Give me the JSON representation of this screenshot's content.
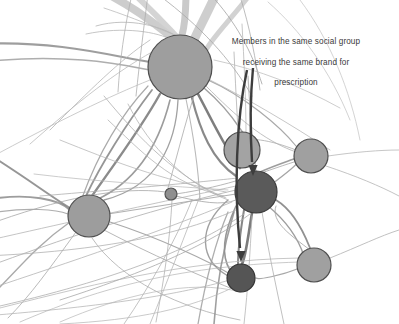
{
  "figure": {
    "type": "network-graph",
    "background_color": "#ffffff",
    "width": 399,
    "height": 324
  },
  "annotation": {
    "name": "social-group-annotation",
    "line1": "Members in the same social group",
    "line2": "receiving the same brand for",
    "line3": "prescription",
    "text_color": "#3a3a3a",
    "leader_color": "#3d3d3d",
    "targets": [
      "node-dark-center",
      "node-dark-bottom"
    ]
  },
  "chart_data": {
    "type": "scatter",
    "title": "",
    "xlabel": "",
    "ylabel": "",
    "xlim": [
      0,
      399
    ],
    "ylim": [
      0,
      324
    ],
    "grid": false,
    "legend": "none",
    "nodes": [
      {
        "id": "node-large-top",
        "x": 180,
        "y": 67,
        "r": 32,
        "fill": "#9e9e9e",
        "stroke": "#4f4f4f"
      },
      {
        "id": "node-left-mid",
        "x": 89,
        "y": 216,
        "r": 21,
        "fill": "#9d9d9d",
        "stroke": "#4f4f4f"
      },
      {
        "id": "node-small-center",
        "x": 171,
        "y": 194,
        "r": 6,
        "fill": "#8f8f8f",
        "stroke": "#525252"
      },
      {
        "id": "node-upper-right",
        "x": 242,
        "y": 150,
        "r": 18,
        "fill": "#a3a3a3",
        "stroke": "#4f4f4f"
      },
      {
        "id": "node-right",
        "x": 311,
        "y": 156,
        "r": 17,
        "fill": "#a0a0a0",
        "stroke": "#4f4f4f"
      },
      {
        "id": "node-dark-center",
        "x": 256,
        "y": 192,
        "r": 21,
        "fill": "#5a5a5a",
        "stroke": "#3a3a3a"
      },
      {
        "id": "node-dark-bottom",
        "x": 241,
        "y": 278,
        "r": 14,
        "fill": "#555555",
        "stroke": "#343434"
      },
      {
        "id": "node-bottom-right",
        "x": 314,
        "y": 265,
        "r": 17,
        "fill": "#a0a0a0",
        "stroke": "#4f4f4f"
      }
    ],
    "edges": [
      {
        "d": "M -20 44 C 60 40 120 58 150 62",
        "w": 2.2,
        "c": "#8d8d8d",
        "o": 0.85
      },
      {
        "d": "M -18 62 C 70 52 128 66 150 70",
        "w": 1.6,
        "c": "#9a9a9a",
        "o": 0.8
      },
      {
        "d": "M 100 -10 C 140 10 160 28 170 36",
        "w": 8.0,
        "c": "#c8c8c8",
        "o": 0.9
      },
      {
        "d": "M 132 -8 C 158 16 170 30 176 36",
        "w": 6.0,
        "c": "#cfcfcf",
        "o": 0.9
      },
      {
        "d": "M 186 -10 C 186 14 184 28 182 35",
        "w": 7.0,
        "c": "#c4c4c4",
        "o": 0.9
      },
      {
        "d": "M 216 -6 C 206 16 198 30 194 40",
        "w": 9.0,
        "c": "#c9c9c9",
        "o": 0.9
      },
      {
        "d": "M 252 -8 C 232 18 212 38 206 50",
        "w": 5.0,
        "c": "#cdcdcd",
        "o": 0.9
      },
      {
        "d": "M 96 26 C 130 16 164 28 176 36",
        "w": 1.0,
        "c": "#b4b4b4",
        "o": 0.8
      },
      {
        "d": "M 104 8 C 140 20 166 32 178 36",
        "w": 1.0,
        "c": "#bcbcbc",
        "o": 0.8
      },
      {
        "d": "M 86 34 C 124 26 158 32 172 40",
        "w": 1.0,
        "c": "#b8b8b8",
        "o": 0.8
      },
      {
        "d": "M 132 -6 C 124 30 120 60 118 92",
        "w": 1.0,
        "c": "#b2b2b2",
        "o": 0.8
      },
      {
        "d": "M 148 -6 C 144 26 140 58 136 96",
        "w": 1.0,
        "c": "#aeaeae",
        "o": 0.8
      },
      {
        "d": "M 160 -4 C 200 26 230 58 252 96",
        "w": 1.0,
        "c": "#a8a8a8",
        "o": 0.8
      },
      {
        "d": "M 210 -6 C 236 22 252 52 262 84",
        "w": 1.0,
        "c": "#a4a4a4",
        "o": 0.8
      },
      {
        "d": "M 240 -4 C 250 28 256 60 260 90",
        "w": 1.0,
        "c": "#acacac",
        "o": 0.8
      },
      {
        "d": "M 170 100 C 160 140 140 180 96 200",
        "w": 1.6,
        "c": "#8b8b8b",
        "o": 0.85
      },
      {
        "d": "M 178 100 C 176 140 160 186 104 200",
        "w": 1.3,
        "c": "#909090",
        "o": 0.85
      },
      {
        "d": "M 192 98 C 200 130 212 160 236 176",
        "w": 2.2,
        "c": "#7c7c7c",
        "o": 0.9
      },
      {
        "d": "M 198 94 C 214 124 226 150 240 168",
        "w": 2.6,
        "c": "#707070",
        "o": 0.9
      },
      {
        "d": "M 186 99 C 192 128 198 160 200 200",
        "w": 1.1,
        "c": "#a8a8a8",
        "o": 0.8
      },
      {
        "d": "M 204 88 C 232 112 240 130 244 134",
        "w": 1.4,
        "c": "#8f8f8f",
        "o": 0.85
      },
      {
        "d": "M 208 80 C 244 96 280 126 296 146",
        "w": 1.2,
        "c": "#9a9a9a",
        "o": 0.85
      },
      {
        "d": "M 160 94 C 140 130 110 170 92 196",
        "w": 2.4,
        "c": "#7e7e7e",
        "o": 0.9
      },
      {
        "d": "M 152 90 C 126 124 100 166 86 196",
        "w": 1.8,
        "c": "#888888",
        "o": 0.88
      },
      {
        "d": "M 148 86 C 118 118 96 160 82 198",
        "w": 1.2,
        "c": "#9b9b9b",
        "o": 0.85
      },
      {
        "d": "M -16 200 C 30 192 60 200 70 210",
        "w": 1.8,
        "c": "#8c8c8c",
        "o": 0.85
      },
      {
        "d": "M -14 214 C 28 206 58 210 68 214",
        "w": 1.2,
        "c": "#9c9c9c",
        "o": 0.82
      },
      {
        "d": "M -18 150 C 24 176 50 196 70 208",
        "w": 2.0,
        "c": "#848484",
        "o": 0.85
      },
      {
        "d": "M 110 222 C 160 238 210 262 230 274",
        "w": 1.2,
        "c": "#9a9a9a",
        "o": 0.85
      },
      {
        "d": "M 108 214 C 160 206 210 198 236 194",
        "w": 1.1,
        "c": "#a0a0a0",
        "o": 0.82
      },
      {
        "d": "M 104 230 C 150 254 200 276 240 292",
        "w": 1.0,
        "c": "#a6a6a6",
        "o": 0.8
      },
      {
        "d": "M 92 238 C 120 280 180 308 240 320",
        "w": 1.0,
        "c": "#adadad",
        "o": 0.8
      },
      {
        "d": "M 70 222 C 30 250 10 280 -14 300",
        "w": 1.4,
        "c": "#979797",
        "o": 0.82
      },
      {
        "d": "M 76 232 C 50 268 30 296 8 318",
        "w": 1.0,
        "c": "#a9a9a9",
        "o": 0.8
      },
      {
        "d": "M 240 168 C 238 130 236 96 234 52",
        "w": 1.0,
        "c": "#b0b0b0",
        "o": 0.78
      },
      {
        "d": "M 246 132 C 246 100 244 60 242 24",
        "w": 1.0,
        "c": "#b4b4b4",
        "o": 0.75
      },
      {
        "d": "M 256 171 C 252 140 250 110 248 76",
        "w": 1.2,
        "c": "#a8a8a8",
        "o": 0.78
      },
      {
        "d": "M 260 172 C 278 164 292 160 296 158",
        "w": 1.6,
        "c": "#8c8c8c",
        "o": 0.85
      },
      {
        "d": "M 272 184 C 288 172 296 166 298 162",
        "w": 1.4,
        "c": "#949494",
        "o": 0.85
      },
      {
        "d": "M 276 200 C 296 212 306 238 310 248",
        "w": 1.8,
        "c": "#828282",
        "o": 0.88
      },
      {
        "d": "M 268 206 C 290 224 300 244 304 256",
        "w": 1.4,
        "c": "#8e8e8e",
        "o": 0.86
      },
      {
        "d": "M 252 213 C 248 236 246 256 242 264",
        "w": 2.6,
        "c": "#6e6e6e",
        "o": 0.9
      },
      {
        "d": "M 244 210 C 240 234 238 254 238 264",
        "w": 2.0,
        "c": "#7a7a7a",
        "o": 0.9
      },
      {
        "d": "M 236 206 C 224 232 220 254 230 270",
        "w": 1.6,
        "c": "#888888",
        "o": 0.88
      },
      {
        "d": "M 228 200 C 196 228 200 260 228 276",
        "w": 1.4,
        "c": "#909090",
        "o": 0.86
      },
      {
        "d": "M 300 268 C 280 276 258 280 256 278",
        "w": 1.2,
        "c": "#999999",
        "o": 0.85
      },
      {
        "d": "M 310 250 C 292 236 270 222 276 206",
        "w": 1.0,
        "c": "#a3a3a3",
        "o": 0.82
      },
      {
        "d": "M 330 258 C 360 246 380 236 399 230",
        "w": 1.0,
        "c": "#b2b2b2",
        "o": 0.8
      },
      {
        "d": "M 328 156 C 356 152 380 150 399 150",
        "w": 1.0,
        "c": "#b6b6b6",
        "o": 0.78
      },
      {
        "d": "M 326 166 C 356 176 380 186 399 196",
        "w": 1.0,
        "c": "#b4b4b4",
        "o": 0.78
      },
      {
        "d": "M 296 150 C 270 140 250 136 226 142",
        "w": 1.0,
        "c": "#adadad",
        "o": 0.8
      },
      {
        "d": "M 294 162 C 262 172 230 186 176 194",
        "w": 1.0,
        "c": "#a6a6a6",
        "o": 0.8
      },
      {
        "d": "M 166 192 C 120 186 60 198 -16 226",
        "w": 1.0,
        "c": "#a8a8a8",
        "o": 0.8
      },
      {
        "d": "M 176 196 C 200 202 222 206 236 200",
        "w": 1.0,
        "c": "#a4a4a4",
        "o": 0.8
      },
      {
        "d": "M 168 188 C 176 160 186 120 194 96",
        "w": 1.0,
        "c": "#aaaaaa",
        "o": 0.8
      },
      {
        "d": "M 172 200 C 170 240 164 280 156 322",
        "w": 1.0,
        "c": "#b0b0b0",
        "o": 0.78
      },
      {
        "d": "M -16 268 C 60 240 140 212 236 190",
        "w": 1.0,
        "c": "#adadad",
        "o": 0.8
      },
      {
        "d": "M -14 290 C 70 262 160 232 232 202",
        "w": 1.0,
        "c": "#b2b2b2",
        "o": 0.78
      },
      {
        "d": "M -16 312 C 80 288 180 260 300 258",
        "w": 1.0,
        "c": "#b6b6b6",
        "o": 0.76
      },
      {
        "d": "M 20 322 C 90 292 170 266 300 262",
        "w": 1.0,
        "c": "#b8b8b8",
        "o": 0.74
      },
      {
        "d": "M 60 322 C 120 296 190 278 240 292",
        "w": 1.0,
        "c": "#bababa",
        "o": 0.74
      },
      {
        "d": "M 124 324 C 150 286 176 240 192 200",
        "w": 1.0,
        "c": "#b0b0b0",
        "o": 0.76
      },
      {
        "d": "M 150 324 C 168 280 186 232 200 196",
        "w": 1.0,
        "c": "#b4b4b4",
        "o": 0.76
      },
      {
        "d": "M 198 324 C 204 290 212 250 228 212",
        "w": 1.3,
        "c": "#9c9c9c",
        "o": 0.82
      },
      {
        "d": "M 214 324 C 216 292 222 252 234 212",
        "w": 1.6,
        "c": "#8e8e8e",
        "o": 0.85
      },
      {
        "d": "M 108 120 C 140 150 170 184 224 196",
        "w": 1.0,
        "c": "#b2b2b2",
        "o": 0.78
      },
      {
        "d": "M 60 140 C 110 160 160 180 226 192",
        "w": 1.0,
        "c": "#b6b6b6",
        "o": 0.76
      },
      {
        "d": "M 34 174 C 100 182 170 186 228 190",
        "w": 1.0,
        "c": "#bababa",
        "o": 0.74
      },
      {
        "d": "M 104 96 C 140 140 180 180 226 198",
        "w": 1.0,
        "c": "#aeaeae",
        "o": 0.78
      },
      {
        "d": "M 128 104 C 150 148 186 184 228 200",
        "w": 1.0,
        "c": "#b2b2b2",
        "o": 0.76
      },
      {
        "d": "M 250 214 C 218 238 160 268 60 300",
        "w": 1.0,
        "c": "#a8a8a8",
        "o": 0.8
      },
      {
        "d": "M 244 214 C 200 244 130 276 0 306",
        "w": 1.0,
        "c": "#adadad",
        "o": 0.78
      },
      {
        "d": "M 236 210 C 190 230 120 250 -14 256",
        "w": 1.0,
        "c": "#b0b0b0",
        "o": 0.78
      },
      {
        "d": "M 230 280 C 180 294 110 306 -16 316",
        "w": 1.0,
        "c": "#b4b4b4",
        "o": 0.76
      },
      {
        "d": "M 232 288 C 190 308 140 320 60 324",
        "w": 1.0,
        "c": "#b8b8b8",
        "o": 0.74
      },
      {
        "d": "M 262 212 C 268 250 276 286 284 324",
        "w": 1.0,
        "c": "#aeaeae",
        "o": 0.78
      },
      {
        "d": "M 252 216 C 250 254 248 288 244 324",
        "w": 1.0,
        "c": "#b2b2b2",
        "o": 0.76
      },
      {
        "d": "M 150 40 C 120 60 90 90 50 130",
        "w": 1.0,
        "c": "#b4b4b4",
        "o": 0.78
      },
      {
        "d": "M 152 52 C 116 72 80 100 30 144",
        "w": 1.0,
        "c": "#b8b8b8",
        "o": 0.76
      },
      {
        "d": "M 150 80 C 110 96 60 120 -14 160",
        "w": 1.0,
        "c": "#bababa",
        "o": 0.74
      },
      {
        "d": "M 214 60 C 260 70 300 86 340 108",
        "w": 1.0,
        "c": "#bcbcbc",
        "o": 0.74
      },
      {
        "d": "M 210 80 C 250 100 290 124 330 150",
        "w": 1.0,
        "c": "#b6b6b6",
        "o": 0.76
      },
      {
        "d": "M 206 86 C 236 116 262 140 296 152",
        "w": 1.0,
        "c": "#b0b0b0",
        "o": 0.78
      },
      {
        "d": "M 300 0 C 330 40 350 90 360 140",
        "w": 1.0,
        "c": "#c2c2c2",
        "o": 0.7
      },
      {
        "d": "M 268 2 C 300 30 330 70 350 120",
        "w": 1.0,
        "c": "#c0c0c0",
        "o": 0.7
      },
      {
        "d": "M 238 178 C 200 182 160 186 40 196",
        "w": 1.0,
        "c": "#aeaeae",
        "o": 0.78
      },
      {
        "d": "M 236 186 C 190 196 140 206 -10 240",
        "w": 1.0,
        "c": "#b2b2b2",
        "o": 0.76
      }
    ],
    "leaders": [
      {
        "id": "leader-to-dark-center",
        "d": "M 253 68 C 250 100 250 130 252 162",
        "arrow_x": 253,
        "arrow_y": 176,
        "w": 2.4,
        "c": "#3d3d3d"
      },
      {
        "id": "leader-to-dark-bottom",
        "d": "M 247 70 C 236 120 234 190 240 248",
        "arrow_x": 241,
        "arrow_y": 262,
        "w": 2.4,
        "c": "#3d3d3d"
      }
    ]
  }
}
